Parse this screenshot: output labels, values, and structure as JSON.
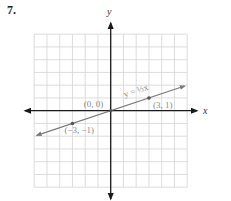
{
  "problem": {
    "number": "7."
  },
  "chart_data": {
    "type": "line",
    "title": "",
    "xlabel": "x",
    "ylabel": "y",
    "xlim": [
      -6,
      6
    ],
    "ylim": [
      -6,
      6
    ],
    "grid": true,
    "series": [
      {
        "name": "y = 1/3 x",
        "equation_label": "y = ⅓x",
        "slope": 0.3333,
        "intercept": 0,
        "x": [
          -5.8,
          5.8
        ],
        "y": [
          -1.933,
          1.933
        ],
        "color": "#7a7a7a"
      }
    ],
    "points": [
      {
        "x": -3,
        "y": -1,
        "label": "(−3, −1)"
      },
      {
        "x": 0,
        "y": 0,
        "label": "(0, 0)"
      },
      {
        "x": 3,
        "y": 1,
        "label": "(3, 1)"
      }
    ],
    "annotations": [
      {
        "text": "y = ⅓x",
        "position": "along line, upper right of origin"
      }
    ]
  },
  "colors": {
    "grid": "#d4d4d4",
    "axis": "#1a1a1a",
    "line": "#7a7a7a",
    "label": "#8a8a8a"
  }
}
